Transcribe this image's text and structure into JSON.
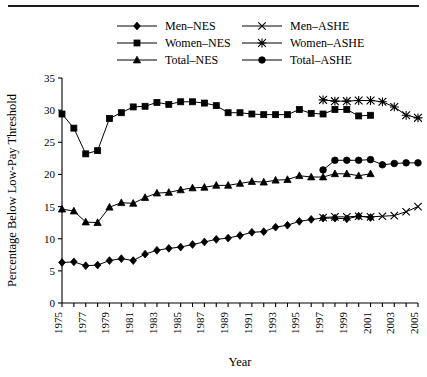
{
  "figure": {
    "has_top_rule": true,
    "background_color": "#ffffff",
    "ink_color": "#000000"
  },
  "chart_data": {
    "type": "line",
    "title": "",
    "xlabel": "Year",
    "ylabel": "Percentage Below Low-Pay Threshold",
    "xlim": [
      1975,
      2005
    ],
    "ylim": [
      0,
      35
    ],
    "ytick_step": 5,
    "yticks": [
      0,
      5,
      10,
      15,
      20,
      25,
      30,
      35
    ],
    "ytick_labels": [
      "0",
      "5",
      "10",
      "15",
      "20",
      "25",
      "30",
      "35"
    ],
    "xticks": [
      1975,
      1976,
      1977,
      1978,
      1979,
      1980,
      1981,
      1982,
      1983,
      1984,
      1985,
      1986,
      1987,
      1988,
      1989,
      1990,
      1991,
      1992,
      1993,
      1994,
      1995,
      1996,
      1997,
      1998,
      1999,
      2000,
      2001,
      2002,
      2003,
      2004,
      2005
    ],
    "xtick_labels": [
      "1975",
      "",
      "1977",
      "",
      "1979",
      "",
      "1981",
      "",
      "1983",
      "",
      "1985",
      "",
      "1987",
      "",
      "1989",
      "",
      "1991",
      "",
      "1993",
      "",
      "1995",
      "",
      "1997",
      "",
      "1999",
      "",
      "2001",
      "",
      "2003",
      "",
      "2005"
    ],
    "grid": false,
    "legend_position": "top-inside",
    "series": [
      {
        "name": "Men–NES",
        "marker": "diamond",
        "x": [
          1975,
          1976,
          1977,
          1978,
          1979,
          1980,
          1981,
          1982,
          1983,
          1984,
          1985,
          1986,
          1987,
          1988,
          1989,
          1990,
          1991,
          1992,
          1993,
          1994,
          1995,
          1996,
          1997,
          1998,
          1999,
          2000,
          2001
        ],
        "values": [
          6.3,
          6.4,
          5.8,
          5.9,
          6.6,
          6.9,
          6.6,
          7.6,
          8.2,
          8.5,
          8.7,
          9.1,
          9.5,
          9.9,
          10.1,
          10.5,
          11.0,
          11.1,
          11.8,
          12.1,
          12.7,
          13.0,
          13.2,
          13.2,
          13.1,
          13.5,
          13.3
        ]
      },
      {
        "name": "Women–NES",
        "marker": "square",
        "x": [
          1975,
          1976,
          1977,
          1978,
          1979,
          1980,
          1981,
          1982,
          1983,
          1984,
          1985,
          1986,
          1987,
          1988,
          1989,
          1990,
          1991,
          1992,
          1993,
          1994,
          1995,
          1996,
          1997,
          1998,
          1999,
          2000,
          2001
        ],
        "values": [
          29.4,
          27.2,
          23.2,
          23.7,
          28.7,
          29.6,
          30.5,
          30.6,
          31.2,
          30.9,
          31.3,
          31.3,
          31.1,
          30.7,
          29.6,
          29.6,
          29.4,
          29.3,
          29.3,
          29.3,
          30.1,
          29.5,
          29.4,
          30.1,
          30.1,
          29.1,
          29.2
        ]
      },
      {
        "name": "Total–NES",
        "marker": "triangle",
        "x": [
          1975,
          1976,
          1977,
          1978,
          1979,
          1980,
          1981,
          1982,
          1983,
          1984,
          1985,
          1986,
          1987,
          1988,
          1989,
          1990,
          1991,
          1992,
          1993,
          1994,
          1995,
          1996,
          1997,
          1998,
          1999,
          2000,
          2001
        ],
        "values": [
          14.6,
          14.3,
          12.6,
          12.5,
          14.9,
          15.6,
          15.5,
          16.4,
          17.1,
          17.2,
          17.6,
          17.9,
          18.0,
          18.3,
          18.3,
          18.6,
          18.9,
          18.8,
          19.1,
          19.2,
          19.8,
          19.6,
          19.6,
          20.1,
          20.1,
          19.8,
          20.1
        ]
      },
      {
        "name": "Men–ASHE",
        "marker": "x",
        "x": [
          1997,
          1998,
          1999,
          2000,
          2001,
          2002,
          2003,
          2004,
          2005
        ],
        "values": [
          13.3,
          13.4,
          13.4,
          13.5,
          13.4,
          13.5,
          13.6,
          14.2,
          15.0
        ]
      },
      {
        "name": "Women–ASHE",
        "marker": "asterisk",
        "x": [
          1997,
          1998,
          1999,
          2000,
          2001,
          2002,
          2003,
          2004,
          2005
        ],
        "values": [
          31.6,
          31.4,
          31.4,
          31.5,
          31.5,
          31.3,
          30.5,
          29.2,
          28.8
        ]
      },
      {
        "name": "Total–ASHE",
        "marker": "circle",
        "x": [
          1997,
          1998,
          1999,
          2000,
          2001,
          2002,
          2003,
          2004,
          2005
        ],
        "values": [
          20.7,
          22.2,
          22.2,
          22.2,
          22.3,
          21.5,
          21.7,
          21.8,
          21.8
        ]
      }
    ],
    "legend": [
      {
        "label": "Men–NES",
        "marker": "diamond",
        "column": 0
      },
      {
        "label": "Women–NES",
        "marker": "square",
        "column": 0
      },
      {
        "label": "Total–NES",
        "marker": "triangle",
        "column": 0
      },
      {
        "label": "Men–ASHE",
        "marker": "x",
        "column": 1
      },
      {
        "label": "Women–ASHE",
        "marker": "asterisk",
        "column": 1
      },
      {
        "label": "Total–ASHE",
        "marker": "circle",
        "column": 1
      }
    ]
  }
}
